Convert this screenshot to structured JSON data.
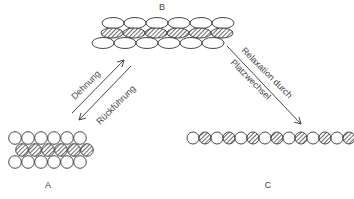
{
  "diagram": {
    "states": {
      "A": {
        "label": "A"
      },
      "B": {
        "label": "B"
      },
      "C": {
        "label": "C"
      }
    },
    "transitions": [
      {
        "from": "A",
        "to": "B",
        "label": "Dehnung"
      },
      {
        "from": "B",
        "to": "A",
        "label": "Rückführung"
      },
      {
        "from": "B",
        "to": "C",
        "label_line1": "Relaxation durch",
        "label_line2": "Platzwechsel"
      }
    ],
    "colors": {
      "stroke": "#333333",
      "fill": "#ffffff",
      "hatch": "#555555"
    }
  }
}
